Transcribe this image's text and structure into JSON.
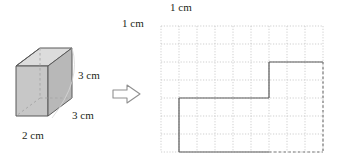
{
  "diagram": {
    "solid": {
      "name": "rectangular-prism",
      "height_label": "3 cm",
      "depth_label": "3 cm",
      "width_label": "2 cm",
      "face_front_color": "#c8c8c8",
      "face_top_color": "#dcdcdc",
      "face_side_color": "#b4b4b4",
      "edge_color": "#595959",
      "hidden_edge_color": "#a0a0a0"
    },
    "arrow": {
      "glyph": "arrow-right",
      "outline_color": "#8c8c8c",
      "fill_color": "#ffffff"
    },
    "grid": {
      "cell_top_label": "1 cm",
      "cell_left_label": "1 cm",
      "cols": 9,
      "rows": 7,
      "cell_px": 18,
      "line_color": "#c9c9c9",
      "shape": {
        "name": "step-polygon",
        "stroke_color": "#595959",
        "hidden_stroke_color": "#7a7a7a",
        "vertices": [
          [
            1,
            4
          ],
          [
            6,
            4
          ],
          [
            6,
            2
          ],
          [
            9,
            2
          ],
          [
            9,
            7
          ],
          [
            6,
            7
          ],
          [
            1,
            7
          ]
        ],
        "solid_edges": [
          [
            [
              1,
              4
            ],
            [
              6,
              4
            ]
          ],
          [
            [
              6,
              4
            ],
            [
              6,
              2
            ]
          ],
          [
            [
              6,
              2
            ],
            [
              9,
              2
            ]
          ],
          [
            [
              1,
              7
            ],
            [
              6,
              7
            ]
          ],
          [
            [
              1,
              4
            ],
            [
              1,
              7
            ]
          ]
        ],
        "hidden_edges": [
          [
            [
              9,
              2
            ],
            [
              9,
              7
            ]
          ],
          [
            [
              6,
              7
            ],
            [
              9,
              7
            ]
          ]
        ]
      }
    }
  }
}
